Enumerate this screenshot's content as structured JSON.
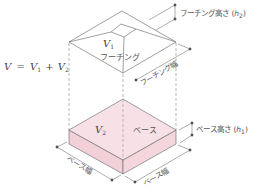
{
  "diagram": {
    "type": "isometric-footing-volume",
    "formula": {
      "lhs": "V",
      "eq": "=",
      "v1": "V",
      "v1_sub": "1",
      "plus": "+",
      "v2": "V",
      "v2_sub": "2"
    },
    "footing": {
      "volume_label": "V",
      "volume_sub": "1",
      "name": "フーチング",
      "height_label": "フーチング高さ (",
      "height_var": "h",
      "height_sub": "2",
      "height_close": ")",
      "width_label": "フーチング幅"
    },
    "base": {
      "volume_label": "V",
      "volume_sub": "2",
      "name": "ベース",
      "height_label": "ベース高さ (",
      "height_var": "h",
      "height_sub": "1",
      "height_close": ")",
      "width_label_left": "ベース幅",
      "width_label_right": "ベース幅"
    },
    "colors": {
      "line": "#666666",
      "base_top": "#f6dce2",
      "base_side": "#f2d0d8",
      "text": "#555555"
    }
  }
}
